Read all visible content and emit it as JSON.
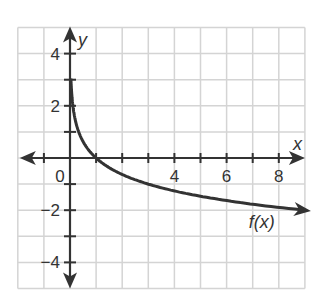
{
  "chart_data": {
    "type": "line",
    "title": "",
    "xlabel": "x",
    "ylabel": "y",
    "xlim": [
      -2,
      9
    ],
    "ylim": [
      -5,
      5
    ],
    "grid": true,
    "grid_step": 1,
    "x_ticks": [
      -1,
      1,
      2,
      3,
      4,
      5,
      6,
      7,
      8
    ],
    "x_tick_labels": [
      {
        "value": 0,
        "label": "0"
      },
      {
        "value": 4,
        "label": "4"
      },
      {
        "value": 6,
        "label": "6"
      },
      {
        "value": 8,
        "label": "8"
      }
    ],
    "y_tick_labels": [
      {
        "value": 4,
        "label": "4"
      },
      {
        "value": 2,
        "label": "2"
      },
      {
        "value": -2,
        "label": "−2"
      },
      {
        "value": -4,
        "label": "−4"
      }
    ],
    "series": [
      {
        "name": "f(x)",
        "label": "f(x)",
        "description": "decreasing logarithmic curve, vertical asymptote at x = 0, passes through (1, 0)",
        "x": [
          0.04,
          0.08,
          0.11,
          0.2,
          0.33,
          0.5,
          1,
          2,
          3,
          4,
          5,
          6,
          7,
          8,
          9
        ],
        "y": [
          2.9,
          2.3,
          2.0,
          1.46,
          1.0,
          0.63,
          0,
          -0.63,
          -1.0,
          -1.26,
          -1.46,
          -1.63,
          -1.77,
          -1.89,
          -2.0
        ],
        "color": "#333333"
      }
    ],
    "annotations": [
      {
        "text": "f(x)",
        "x": 7.0,
        "y": -2.7
      }
    ]
  },
  "colors": {
    "grid": "#d4d4d4",
    "axis": "#333333",
    "curve": "#333333",
    "text": "#333333"
  }
}
